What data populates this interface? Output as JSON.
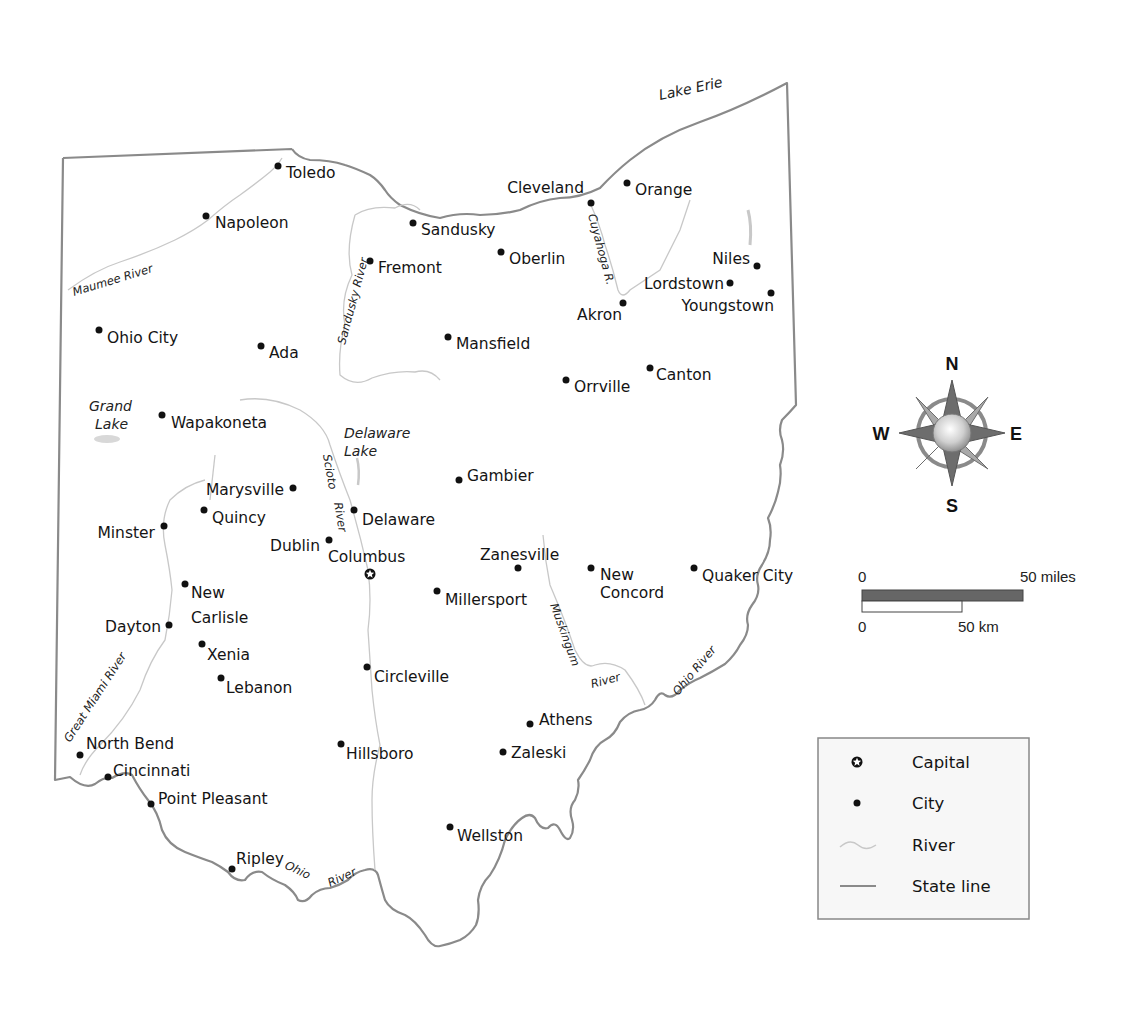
{
  "map": {
    "water_bodies": {
      "lake_erie": "Lake Erie",
      "grand_lake_1": "Grand",
      "grand_lake_2": "Lake",
      "delaware_lake_1": "Delaware",
      "delaware_lake_2": "Lake"
    },
    "rivers": {
      "maumee": "Maumee River",
      "sandusky": "Sandusky River",
      "cuyahoga": "Cuyahoga R.",
      "scioto_1": "Scioto",
      "scioto_2": "River",
      "great_miami": "Great Miami River",
      "muskingum_1": "Muskingum",
      "muskingum_2": "River",
      "ohio_east": "Ohio River",
      "ohio_south_1": "Ohio",
      "ohio_south_2": "River"
    },
    "capital": {
      "name": "Columbus"
    },
    "cities": [
      {
        "name": "Toledo"
      },
      {
        "name": "Napoleon"
      },
      {
        "name": "Sandusky"
      },
      {
        "name": "Fremont"
      },
      {
        "name": "Oberlin"
      },
      {
        "name": "Cleveland"
      },
      {
        "name": "Orange"
      },
      {
        "name": "Niles"
      },
      {
        "name": "Lordstown"
      },
      {
        "name": "Youngstown"
      },
      {
        "name": "Akron"
      },
      {
        "name": "Ohio City"
      },
      {
        "name": "Ada"
      },
      {
        "name": "Mansfield"
      },
      {
        "name": "Orrville"
      },
      {
        "name": "Canton"
      },
      {
        "name": "Wapakoneta"
      },
      {
        "name": "Gambier"
      },
      {
        "name": "Marysville"
      },
      {
        "name": "Quincy"
      },
      {
        "name": "Delaware"
      },
      {
        "name": "Minster"
      },
      {
        "name": "Dublin"
      },
      {
        "name": "Zanesville"
      },
      {
        "name": "New"
      },
      {
        "name": "Concord"
      },
      {
        "name": "Quaker City"
      },
      {
        "name": "Millersport"
      },
      {
        "name": "New"
      },
      {
        "name": "Carlisle"
      },
      {
        "name": "Dayton"
      },
      {
        "name": "Xenia"
      },
      {
        "name": "Lebanon"
      },
      {
        "name": "Circleville"
      },
      {
        "name": "Athens"
      },
      {
        "name": "North Bend"
      },
      {
        "name": "Hillsboro"
      },
      {
        "name": "Zaleski"
      },
      {
        "name": "Cincinnati"
      },
      {
        "name": "Point Pleasant"
      },
      {
        "name": "Wellston"
      },
      {
        "name": "Ripley"
      }
    ]
  },
  "compass": {
    "north": "N",
    "south": "S",
    "east": "E",
    "west": "W"
  },
  "scale_bar": {
    "miles_start": "0",
    "miles_end": "50 miles",
    "km_start": "0",
    "km_end": "50 km"
  },
  "legend": {
    "items": [
      {
        "label": "Capital",
        "symbol": "capital-star-icon"
      },
      {
        "label": "City",
        "symbol": "city-dot-icon"
      },
      {
        "label": "River",
        "symbol": "river-line-icon"
      },
      {
        "label": "State line",
        "symbol": "state-line-icon"
      }
    ]
  },
  "colors": {
    "state_line": "#8a8a8a",
    "river": "#c8c8c8",
    "compass_dark": "#6d6d6d",
    "compass_light": "#a9a9a9",
    "legend_bg": "#f7f7f7",
    "legend_border": "#888888",
    "scale_fill": "#666666"
  }
}
